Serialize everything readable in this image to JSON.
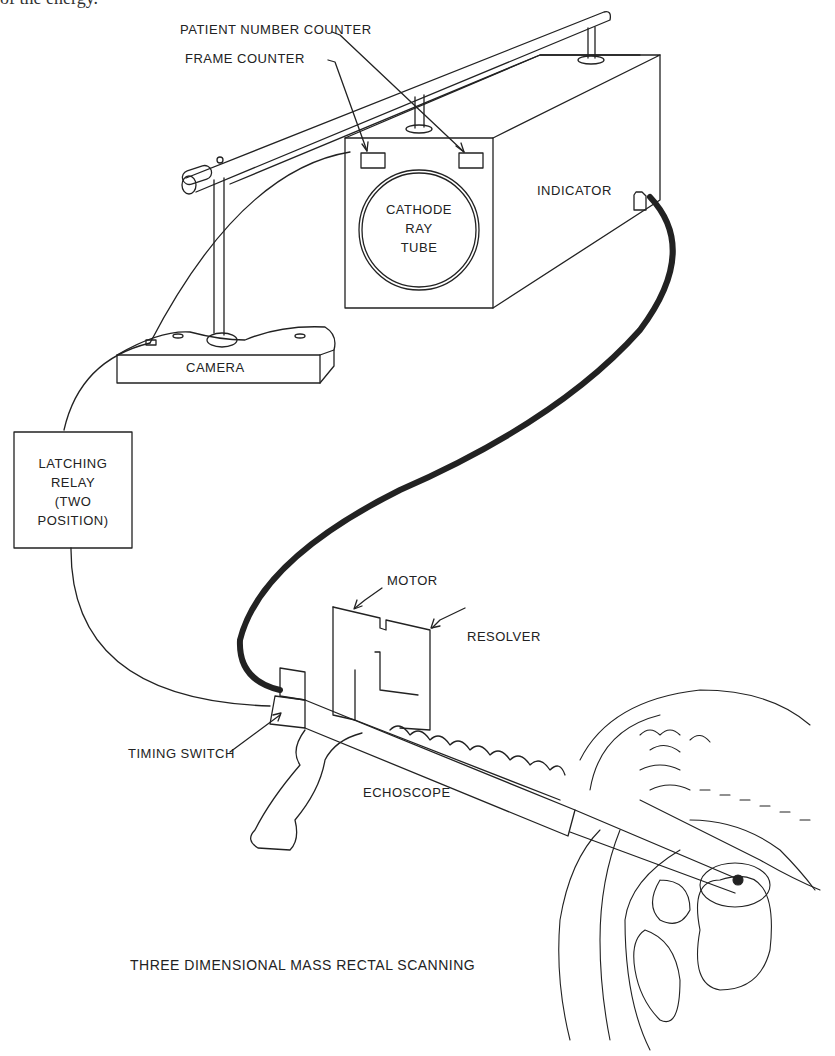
{
  "page": {
    "clipped_top_text": "of the energy."
  },
  "figure": {
    "title": "THREE DIMENSIONAL MASS RECTAL SCANNING",
    "labels": {
      "patient_number_counter": "PATIENT NUMBER COUNTER",
      "frame_counter": "FRAME COUNTER",
      "cathode_ray_tube": [
        "CATHODE",
        "RAY",
        "TUBE"
      ],
      "indicator": "INDICATOR",
      "camera": "CAMERA",
      "latching_relay": [
        "LATCHING",
        "RELAY",
        "(TWO",
        "POSITION)"
      ],
      "motor": "MOTOR",
      "resolver": "RESOLVER",
      "timing_switch": "TIMING SWITCH",
      "echoscope": "ECHOSCOPE"
    },
    "colors": {
      "line": "#222222",
      "background": "#ffffff"
    }
  }
}
